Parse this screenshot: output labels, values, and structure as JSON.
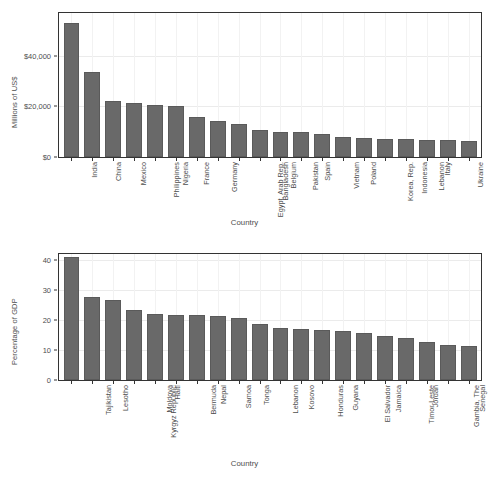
{
  "figure": {
    "background": "#ffffff",
    "bar_color": "#696969",
    "grid_color": "#ebebeb",
    "panel_border": "#333333"
  },
  "chart_data": [
    {
      "id": "remittances-absolute",
      "type": "bar",
      "title": "",
      "xlabel": "Country",
      "ylabel": "Millions of US$",
      "ylim": [
        0,
        57000
      ],
      "grid": true,
      "legend": "none",
      "yticks": [
        0,
        20000,
        40000
      ],
      "ytick_labels": [
        "$0",
        "$20,000",
        "$40,000"
      ],
      "categories": [
        "India",
        "China",
        "Mexico",
        "Philippines",
        "Nigeria",
        "France",
        "Germany",
        "Egypt, Arab Rep.",
        "Bangladesh",
        "Belgium",
        "Pakistan",
        "Spain",
        "Vietnam",
        "Poland",
        "Korea, Rep.",
        "Indonesia",
        "Lebanon",
        "Italy",
        "Ukraine",
        "Morocco"
      ],
      "values": [
        53000,
        33500,
        22000,
        21200,
        20600,
        20000,
        15800,
        14300,
        13200,
        10500,
        10000,
        9800,
        9200,
        8100,
        7500,
        7300,
        7100,
        6900,
        6700,
        6500
      ]
    },
    {
      "id": "remittances-pct-gdp",
      "type": "bar",
      "title": "",
      "xlabel": "Country",
      "ylabel": "Percentage of GDP",
      "ylim": [
        0,
        42
      ],
      "grid": true,
      "legend": "none",
      "yticks": [
        0,
        10,
        20,
        30,
        40
      ],
      "ytick_labels": [
        "0",
        "10",
        "20",
        "30",
        "40"
      ],
      "categories": [
        "Tajikistan",
        "Lesotho",
        "Kyrgyz Republic",
        "Moldova",
        "Haiti",
        "Bermuda",
        "Nepal",
        "Samoa",
        "Tonga",
        "Lebanon",
        "Kosovo",
        "Honduras",
        "Guyana",
        "El Salvador",
        "Jamaica",
        "Timor-Leste",
        "Jordan",
        "Gambia, The",
        "Senegal",
        "Bosnia and Herzegovina"
      ],
      "values": [
        41.0,
        27.8,
        26.6,
        23.2,
        22.0,
        21.8,
        21.6,
        21.4,
        20.7,
        18.7,
        17.4,
        16.9,
        16.6,
        16.4,
        15.6,
        14.6,
        14.1,
        12.6,
        11.6,
        11.3
      ]
    }
  ]
}
